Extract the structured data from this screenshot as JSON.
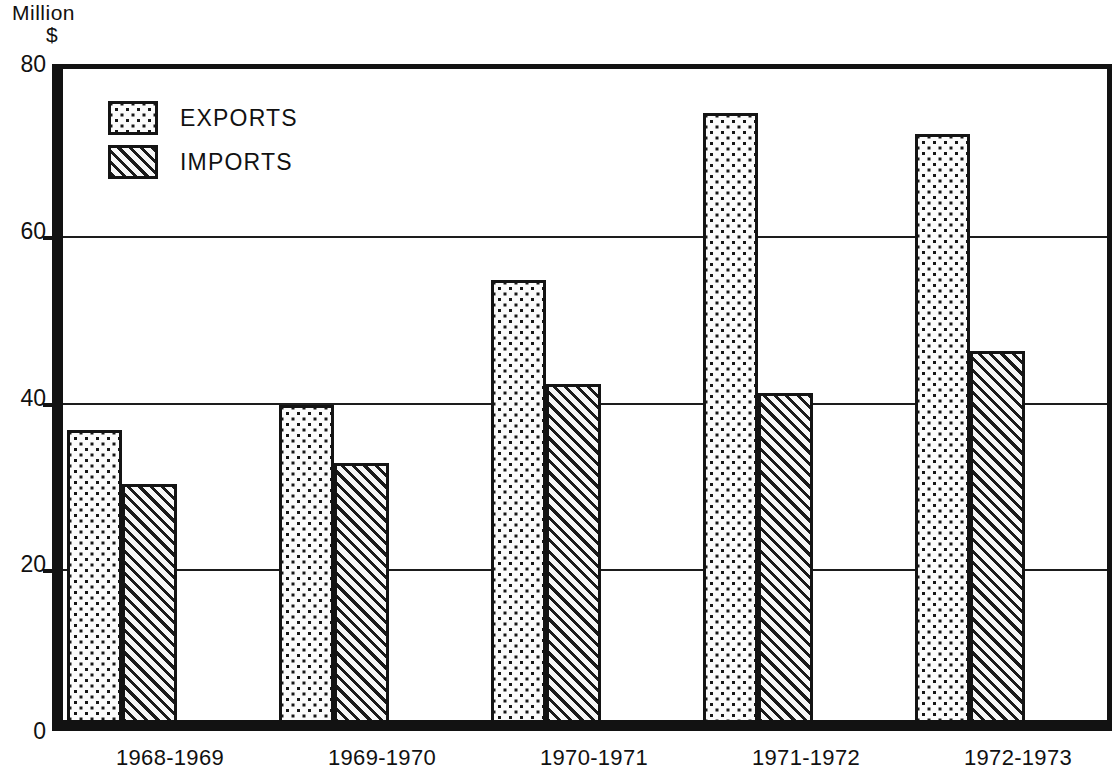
{
  "axis": {
    "y_unit_line1": "Million",
    "y_unit_line2": "$",
    "y_ticks": [
      "0",
      "20",
      "40",
      "60",
      "80"
    ]
  },
  "legend": {
    "items": [
      {
        "label": "EXPORTS",
        "pattern": "dots-swatch-icon"
      },
      {
        "label": "IMPORTS",
        "pattern": "diagonal-hatch-swatch-icon"
      }
    ]
  },
  "chart_data": {
    "type": "bar",
    "title": "",
    "xlabel": "",
    "ylabel": "Million $",
    "ylim": [
      0,
      80
    ],
    "yticks": [
      0,
      20,
      40,
      60,
      80
    ],
    "grid": true,
    "legend_position": "top-left",
    "categories": [
      "1968-1969",
      "1969-1970",
      "1970-1971",
      "1971-1972",
      "1972-1973"
    ],
    "series": [
      {
        "name": "EXPORTS",
        "values": [
          35.5,
          38.5,
          53.5,
          73.5,
          71.0
        ]
      },
      {
        "name": "IMPORTS",
        "values": [
          29.0,
          31.5,
          41.0,
          40.0,
          45.0
        ]
      }
    ]
  }
}
